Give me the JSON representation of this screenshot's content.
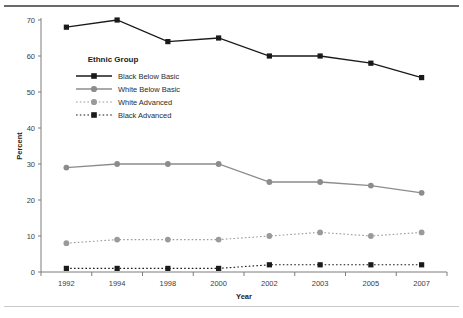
{
  "chart_data": {
    "type": "line",
    "title": "",
    "xlabel": "Year",
    "ylabel": "Percent",
    "categories": [
      "1992",
      "1994",
      "1998",
      "2000",
      "2002",
      "2003",
      "2005",
      "2007"
    ],
    "ylim": [
      0,
      70
    ],
    "yticks": [
      0,
      10,
      20,
      30,
      40,
      50,
      60,
      70
    ],
    "ytick_labels": [
      "0",
      "10",
      "20",
      "30",
      "40",
      "50",
      "60",
      "70"
    ],
    "grid": false,
    "legend_position": "upper-left-inside",
    "legend_title": "Ethnic Group",
    "series": [
      {
        "name": "Black Below Basic",
        "values": [
          68,
          70,
          64,
          65,
          60,
          60,
          58,
          54
        ],
        "color": "#1a1a1a",
        "marker": "square",
        "line_style": "solid"
      },
      {
        "name": "White Below Basic",
        "values": [
          29,
          30,
          30,
          30,
          25,
          25,
          24,
          22
        ],
        "color": "#8c8c8c",
        "marker": "circle",
        "line_style": "solid"
      },
      {
        "name": "White Advanced",
        "values": [
          8,
          9,
          9,
          9,
          10,
          11,
          10,
          11
        ],
        "color": "#9a9a9a",
        "marker": "circle",
        "line_style": "dotted"
      },
      {
        "name": "Black Advanced",
        "values": [
          1,
          1,
          1,
          1,
          2,
          2,
          2,
          2
        ],
        "color": "#1a1a1a",
        "marker": "square",
        "line_style": "dotted"
      }
    ]
  },
  "axis": {
    "x_title": "Year",
    "y_title": "Percent",
    "x_labels": [
      "1992",
      "1994",
      "1998",
      "2000",
      "2002",
      "2003",
      "2005",
      "2007"
    ],
    "y_labels": [
      "70",
      "60",
      "50",
      "40",
      "30",
      "20",
      "10",
      "0"
    ]
  },
  "legend": {
    "title": "Ethnic Group",
    "items": [
      {
        "label": "Black Below Basic"
      },
      {
        "label": "White Below Basic"
      },
      {
        "label": "White Advanced"
      },
      {
        "label": "Black Advanced"
      }
    ]
  }
}
